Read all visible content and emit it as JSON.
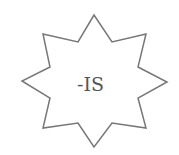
{
  "diagram": {
    "shape": "eight-point-star",
    "label": "-IS",
    "stroke_color": "#777777",
    "fill_color": "#ffffff",
    "text_color": "#555555"
  }
}
